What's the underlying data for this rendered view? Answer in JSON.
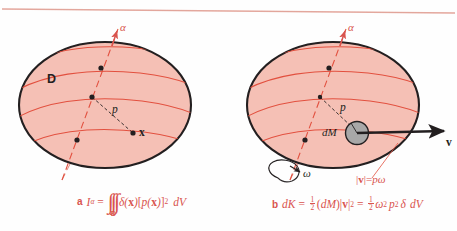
{
  "figure": {
    "title_rule": "horizontal-rule",
    "background_color": "#fefefe",
    "body_fill_color": "#f5c0b5",
    "body_stroke_color": "#231f20",
    "accent_color": "#d9544e",
    "dM_fill_color": "#a8a8a8"
  },
  "panel_a": {
    "caption_tag": "a",
    "region_label": "D",
    "axis_label": "α",
    "distance_label": "p",
    "point_label": "x",
    "formula": {
      "lhs_symbol": "I",
      "lhs_subscript": "α",
      "equals": "=",
      "integral_glyphs": "∫∫∫",
      "integral_subscript": "D",
      "integrand_density": "δ(",
      "integrand_density_var": "x",
      "integrand_density_close": ")",
      "bracket_open": "[",
      "integrand_p": "p(",
      "integrand_p_var": "x",
      "integrand_p_close": ")",
      "bracket_close": "]",
      "exponent": "2",
      "differential": "dV",
      "plain_text": "a  Iα = ∫∫∫_D δ(x)[p(x)]² dV"
    }
  },
  "panel_b": {
    "caption_tag": "b",
    "axis_label": "α",
    "distance_label": "p",
    "mass_element_label": "dM",
    "velocity_label": "v",
    "angular_velocity_label": "ω",
    "speed_relation": {
      "magnitude_open": "|",
      "vector": "v",
      "magnitude_close": "|",
      "equals": "=",
      "rhs_p": "p",
      "rhs_omega": "ω",
      "plain_text": "|v| = pω"
    },
    "formula": {
      "lhs": "dK",
      "equals1": "=",
      "half_num": "1",
      "half_den": "2",
      "dM_open": "(",
      "dM": "dM",
      "dM_close": ")",
      "v_open": "|",
      "v": "v",
      "v_close": "|",
      "v_exp": "2",
      "equals2": "=",
      "omega": "ω",
      "omega_exp": "2",
      "p": "p",
      "p_exp": "2",
      "delta": "δ",
      "differential": "dV",
      "plain_text": "b  dK = ½(dM)|v|² = ½ ω² p² δ dV"
    }
  }
}
